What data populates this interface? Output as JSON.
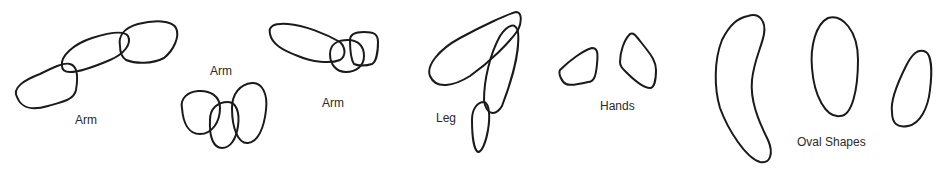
{
  "diagram": {
    "background": "#ffffff",
    "stroke_color": "#1a1a1a",
    "groups": [
      {
        "id": "arm-1",
        "label": "Arm",
        "label_pos": [
          75,
          114
        ],
        "shape_count": 3
      },
      {
        "id": "arm-2",
        "label": "Arm",
        "label_pos": [
          210,
          65
        ],
        "shape_count": 3
      },
      {
        "id": "arm-3",
        "label": "Arm",
        "label_pos": [
          322,
          97
        ],
        "shape_count": 3
      },
      {
        "id": "leg",
        "label": "Leg",
        "label_pos": [
          436,
          112
        ],
        "shape_count": 3
      },
      {
        "id": "hands",
        "label": "Hands",
        "label_pos": [
          600,
          100
        ],
        "shape_count": 2
      },
      {
        "id": "oval-shapes",
        "label": "Oval Shapes",
        "label_pos": [
          797,
          136
        ],
        "shape_count": 3
      }
    ]
  }
}
